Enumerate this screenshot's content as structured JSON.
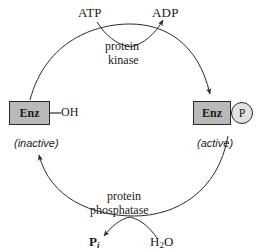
{
  "figure": {
    "type": "reaction-cycle-diagram",
    "background_color": "#ffffff",
    "stroke_color": "#2a2a2a",
    "box_fill_color": "#b9b9b9",
    "circle_fill_color": "#e2e2e2"
  },
  "nodes": {
    "left_enzyme": {
      "box_label": "Enz",
      "attachment": "OH",
      "state": "(inactive)"
    },
    "right_enzyme": {
      "box_label": "Enz",
      "attachment": "P",
      "state": "(active)"
    }
  },
  "top_reaction": {
    "enzyme_line1": "protein",
    "enzyme_line2": "kinase",
    "substrate": "ATP",
    "product": "ADP"
  },
  "bottom_reaction": {
    "enzyme_line1": "protein",
    "enzyme_line2": "phosphatase",
    "substrate_main": "H",
    "substrate_sub": "2",
    "substrate_tail": "O",
    "product_main": "P",
    "product_sub": "i"
  }
}
